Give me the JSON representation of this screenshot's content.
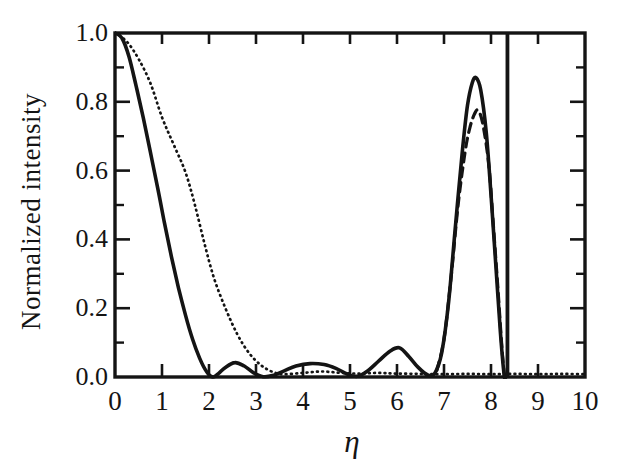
{
  "figure": {
    "background": "#ffffff",
    "ink_color": "#141414",
    "y_axis_title": "Normalized intensity",
    "x_axis_title": "η"
  },
  "chart_data": {
    "type": "line",
    "title": "",
    "xlabel": "η",
    "ylabel": "Normalized intensity",
    "xlim": [
      0,
      10
    ],
    "ylim": [
      0,
      1.0
    ],
    "grid": false,
    "legend": "none",
    "x_tick_labels": [
      "0",
      "1",
      "2",
      "3",
      "4",
      "5",
      "6",
      "7",
      "8",
      "9",
      "10"
    ],
    "x_major_ticks": [
      0,
      1,
      2,
      3,
      4,
      5,
      6,
      7,
      8,
      9,
      10
    ],
    "y_tick_labels": [
      "1.0",
      "0.8",
      "0.6",
      "0.4",
      "0.2",
      "0.0"
    ],
    "y_major_ticks": [
      1.0,
      0.8,
      0.6,
      0.4,
      0.2,
      0.0
    ],
    "y_minor_ticks": [
      0.9,
      0.7,
      0.5,
      0.3,
      0.1
    ],
    "series": [
      {
        "name": "solid-curve",
        "style": "solid",
        "points": [
          [
            0,
            1.0
          ],
          [
            0.15,
            0.985
          ],
          [
            0.3,
            0.93
          ],
          [
            0.45,
            0.845
          ],
          [
            0.6,
            0.755
          ],
          [
            0.75,
            0.655
          ],
          [
            0.9,
            0.555
          ],
          [
            1.05,
            0.45
          ],
          [
            1.2,
            0.35
          ],
          [
            1.35,
            0.26
          ],
          [
            1.5,
            0.18
          ],
          [
            1.65,
            0.11
          ],
          [
            1.8,
            0.055
          ],
          [
            1.95,
            0.015
          ],
          [
            2.08,
            0.0
          ],
          [
            2.2,
            0.01
          ],
          [
            2.35,
            0.028
          ],
          [
            2.55,
            0.042
          ],
          [
            2.75,
            0.032
          ],
          [
            2.95,
            0.012
          ],
          [
            3.15,
            0.001
          ],
          [
            3.35,
            0.004
          ],
          [
            3.6,
            0.018
          ],
          [
            3.85,
            0.032
          ],
          [
            4.15,
            0.039
          ],
          [
            4.45,
            0.036
          ],
          [
            4.7,
            0.025
          ],
          [
            4.95,
            0.008
          ],
          [
            5.15,
            0.002
          ],
          [
            5.35,
            0.015
          ],
          [
            5.6,
            0.045
          ],
          [
            5.85,
            0.075
          ],
          [
            6.05,
            0.085
          ],
          [
            6.25,
            0.06
          ],
          [
            6.45,
            0.028
          ],
          [
            6.65,
            0.006
          ],
          [
            6.8,
            0.01
          ],
          [
            6.95,
            0.07
          ],
          [
            7.1,
            0.22
          ],
          [
            7.25,
            0.45
          ],
          [
            7.4,
            0.67
          ],
          [
            7.5,
            0.79
          ],
          [
            7.6,
            0.855
          ],
          [
            7.68,
            0.87
          ],
          [
            7.78,
            0.835
          ],
          [
            7.9,
            0.71
          ],
          [
            8.0,
            0.53
          ],
          [
            8.1,
            0.33
          ],
          [
            8.2,
            0.13
          ],
          [
            8.28,
            0.005
          ],
          [
            8.31,
            0.0
          ]
        ]
      },
      {
        "name": "dotted-curve",
        "style": "dotted",
        "points": [
          [
            0,
            1.0
          ],
          [
            0.25,
            0.975
          ],
          [
            0.5,
            0.925
          ],
          [
            0.75,
            0.855
          ],
          [
            1.0,
            0.755
          ],
          [
            1.25,
            0.675
          ],
          [
            1.5,
            0.595
          ],
          [
            1.7,
            0.5
          ],
          [
            1.9,
            0.39
          ],
          [
            2.1,
            0.29
          ],
          [
            2.35,
            0.2
          ],
          [
            2.6,
            0.125
          ],
          [
            2.85,
            0.07
          ],
          [
            3.1,
            0.035
          ],
          [
            3.35,
            0.015
          ],
          [
            3.6,
            0.008
          ],
          [
            4.0,
            0.012
          ],
          [
            4.4,
            0.016
          ],
          [
            4.8,
            0.012
          ],
          [
            5.2,
            0.01
          ],
          [
            5.6,
            0.012
          ],
          [
            6.0,
            0.01
          ],
          [
            6.5,
            0.009
          ],
          [
            7.0,
            0.008
          ],
          [
            7.5,
            0.009
          ],
          [
            8.0,
            0.008
          ],
          [
            8.5,
            0.009
          ],
          [
            9.0,
            0.008
          ],
          [
            9.5,
            0.009
          ],
          [
            10,
            0.008
          ]
        ]
      },
      {
        "name": "dashed-curve",
        "style": "dashed",
        "points": [
          [
            6.85,
            0.02
          ],
          [
            7.0,
            0.11
          ],
          [
            7.15,
            0.29
          ],
          [
            7.3,
            0.5
          ],
          [
            7.45,
            0.655
          ],
          [
            7.55,
            0.725
          ],
          [
            7.65,
            0.765
          ],
          [
            7.72,
            0.775
          ],
          [
            7.82,
            0.74
          ],
          [
            7.95,
            0.62
          ],
          [
            8.05,
            0.44
          ],
          [
            8.15,
            0.25
          ],
          [
            8.24,
            0.07
          ],
          [
            8.29,
            0.0
          ]
        ]
      }
    ],
    "annotations": [
      {
        "type": "vertical-spike",
        "x": 8.35,
        "y_from": 0.0,
        "y_to": 1.0,
        "note": "narrow off-scale peak clipped at top frame"
      }
    ]
  }
}
